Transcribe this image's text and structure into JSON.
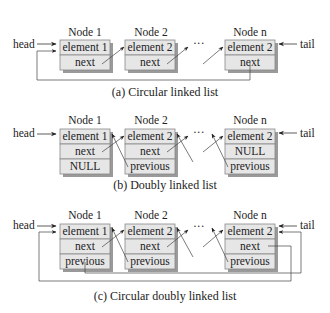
{
  "diagrams": [
    {
      "id": "a",
      "caption": "(a) Circular linked list",
      "head_label": "head",
      "tail_label": "tail",
      "ellipsis": "···",
      "nodes": [
        {
          "title": "Node 1",
          "cells": [
            "element 1",
            "next"
          ]
        },
        {
          "title": "Node 2",
          "cells": [
            "element 2",
            "next"
          ]
        },
        {
          "title": "Node n",
          "cells": [
            "element 2",
            "next"
          ]
        }
      ]
    },
    {
      "id": "b",
      "caption": "(b) Doubly linked list",
      "head_label": "head",
      "tail_label": "tail",
      "ellipsis": "···",
      "nodes": [
        {
          "title": "Node 1",
          "cells": [
            "element 1",
            "next",
            "NULL"
          ]
        },
        {
          "title": "Node 2",
          "cells": [
            "element 2",
            "next",
            "previous"
          ]
        },
        {
          "title": "Node n",
          "cells": [
            "element 2",
            "NULL",
            "previous"
          ]
        }
      ]
    },
    {
      "id": "c",
      "caption": "(c) Circular doubly linked list",
      "head_label": "head",
      "tail_label": "tail",
      "ellipsis": "···",
      "nodes": [
        {
          "title": "Node 1",
          "cells": [
            "element 1",
            "next",
            "previous"
          ]
        },
        {
          "title": "Node 2",
          "cells": [
            "element 2",
            "next",
            "previous"
          ]
        },
        {
          "title": "Node n",
          "cells": [
            "element 2",
            "next",
            "previous"
          ]
        }
      ]
    }
  ]
}
